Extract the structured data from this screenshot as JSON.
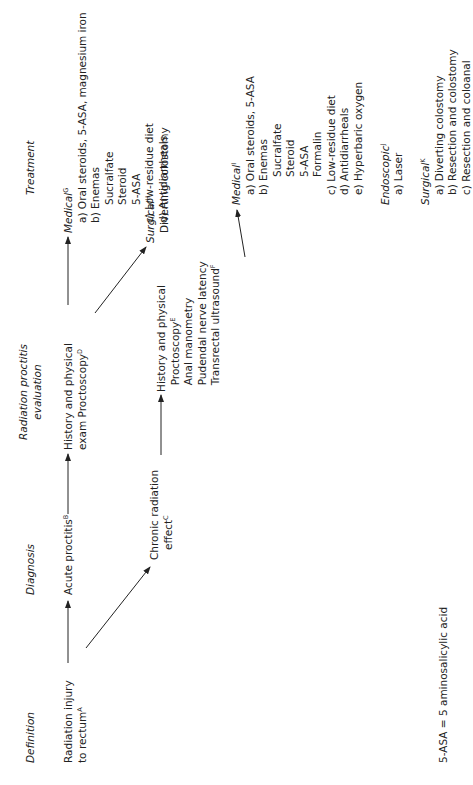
{
  "headers": {
    "definition": "Definition",
    "diagnosis": "Diagnosis",
    "evaluation": [
      "Radiation proctitis",
      "evaluation"
    ],
    "treatment": "Treatment"
  },
  "definition": {
    "lines": [
      "Radiation injury",
      "to rectum"
    ],
    "sup": "A"
  },
  "acute": {
    "label": "Acute proctitis",
    "sup": "B"
  },
  "chronic": {
    "lines": [
      "Chronic radiation",
      "effect"
    ],
    "sup": "C"
  },
  "acute_eval": {
    "lines": [
      "History and physical",
      "exam Proctoscopy"
    ],
    "sup": "D"
  },
  "chronic_eval": {
    "lines": [
      "History and physical",
      "Proctoscopy",
      "Anal manometry",
      "Pudendal nerve latency",
      "Transrectal ultrasound"
    ],
    "sup_proctoscopy": "E",
    "sup_ultrasound": "F"
  },
  "acute_treatment": {
    "medical": {
      "label": "Medical",
      "sup": "G",
      "items": [
        "a) Oral steroids, 5-ASA, magnesium iron",
        "b) Enemas",
        "Sucralfate",
        "Steroid",
        "5-ASA",
        "c) Low-residue diet",
        "d) Antidiarrheals"
      ]
    },
    "surgical": {
      "label": "Surgical",
      "sup": "H",
      "items": [
        "Diverting colostomy"
      ]
    }
  },
  "chronic_treatment": {
    "medical": {
      "label": "Medical",
      "sup": "I",
      "items": [
        "a) Oral steroids, 5-ASA",
        "b) Enemas",
        "Sucralfate",
        "Steroid",
        "5-ASA",
        "Formalin",
        "c) Low-residue diet",
        "d) Antidiarrheals",
        "e) Hyperbaric oxygen"
      ]
    },
    "endoscopic": {
      "label": "Endoscopic",
      "sup": "J",
      "items": [
        "a) Laser"
      ]
    },
    "surgical": {
      "label": "Surgical",
      "sup": "K",
      "items": [
        "a) Diverting colostomy",
        "b) Resection and colostomy",
        "c) Resection and coloanal"
      ]
    }
  },
  "footnote": "5-ASA = 5 aminosalicylic acid"
}
